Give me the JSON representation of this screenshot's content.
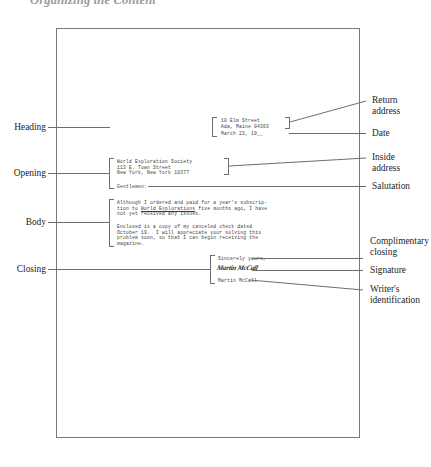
{
  "running_head": "Organizing the Content",
  "letter": {
    "return_address": {
      "line1": "10 Elm Street",
      "line2": "Ada, Maine 04303"
    },
    "date": "March 23, 19__",
    "inside_address": {
      "line1": "World Exploration Society",
      "line2": "113 E. Town Street",
      "line3": "New York, New York 10377"
    },
    "salutation": "Gentlemen:",
    "body": {
      "paragraph1_line1": "Although I ordered and paid for a year's subscrip-",
      "paragraph1_line2_pre": "tion to ",
      "paragraph1_line2_italic": "World Explorations",
      "paragraph1_line2_post": " five months ago, I have",
      "paragraph1_line3": "not yet received any issues.",
      "paragraph2_line1": "Enclosed is a copy of my canceled check dated",
      "paragraph2_line2": "October 19.  I will appreciate your solving this",
      "paragraph2_line3": "problem soon, so that I can begin receiving the",
      "paragraph2_line4": "magazine."
    },
    "complimentary_closing": "Sincerely yours,",
    "signature": "Martin McCall",
    "writer_identification": "Martin McCall"
  },
  "labels": {
    "left": [
      {
        "id": "heading",
        "text": "Heading"
      },
      {
        "id": "opening",
        "text": "Opening"
      },
      {
        "id": "body",
        "text": "Body"
      },
      {
        "id": "closing",
        "text": "Closing"
      }
    ],
    "right": [
      {
        "id": "return-address",
        "text": "Return\naddress"
      },
      {
        "id": "date",
        "text": "Date"
      },
      {
        "id": "inside-address",
        "text": "Inside\naddress"
      },
      {
        "id": "salutation",
        "text": "Salutation"
      },
      {
        "id": "complimentary-closing",
        "text": "Complimentary\nclosing"
      },
      {
        "id": "signature",
        "text": "Signature"
      },
      {
        "id": "writer-identification",
        "text": "Writer's\nidentification"
      }
    ]
  },
  "colors": {
    "ink": "#3a3a3a",
    "rule": "#6e6e6e",
    "page_border": "#777777",
    "label": "#242424",
    "running_head": "#9a9a9a"
  }
}
